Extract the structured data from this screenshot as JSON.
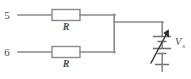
{
  "figure": {
    "background_color": "#ffffff",
    "wire_color": "#8a8a8a",
    "label_color": "#4a4a4a"
  },
  "terminals": [
    {
      "id": "terminal-5",
      "label": "5"
    },
    {
      "id": "terminal-6",
      "label": "6"
    }
  ],
  "components": [
    {
      "id": "resistor-top",
      "label": "R",
      "type": "resistor"
    },
    {
      "id": "resistor-bottom",
      "label": "R",
      "type": "resistor"
    }
  ],
  "source": {
    "id": "variable-voltage-source",
    "label": "V",
    "subscript": "s",
    "type": "variable-battery",
    "cells": 2
  }
}
